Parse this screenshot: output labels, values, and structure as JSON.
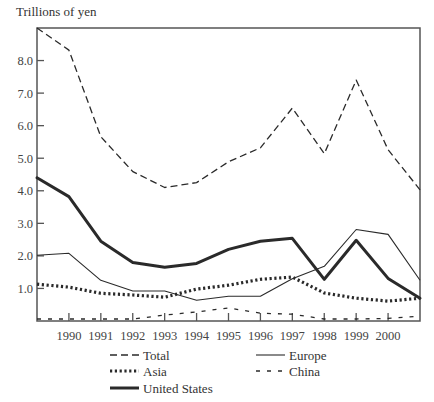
{
  "chart_data": {
    "type": "line",
    "title": "",
    "ylabel": "Trillions of yen",
    "xlabel": "",
    "x": [
      1989,
      1990,
      1991,
      1992,
      1993,
      1994,
      1995,
      1996,
      1997,
      1998,
      1999,
      2000,
      2001
    ],
    "x_tick_labels": [
      "1990",
      "1991",
      "1992",
      "1993",
      "1994",
      "1995",
      "1996",
      "1997",
      "1998",
      "1999",
      "2000"
    ],
    "y_tick_labels": [
      "1.0",
      "2.0",
      "3.0",
      "4.0",
      "5.0",
      "6.0",
      "7.0",
      "8.0"
    ],
    "y_ticks": [
      1,
      2,
      3,
      4,
      5,
      6,
      7,
      8
    ],
    "ylim": [
      0,
      9
    ],
    "xlim": [
      1989,
      2001
    ],
    "grid": false,
    "legend_position": "bottom",
    "series": [
      {
        "name": "Total",
        "style": "dashed",
        "values": [
          9.0,
          8.32,
          5.66,
          4.59,
          4.1,
          4.25,
          4.89,
          5.32,
          6.54,
          5.14,
          7.4,
          5.26,
          4.03
        ]
      },
      {
        "name": "Asia",
        "style": "dotted",
        "values": [
          1.13,
          1.04,
          0.85,
          0.8,
          0.73,
          0.98,
          1.1,
          1.28,
          1.35,
          0.86,
          0.7,
          0.61,
          0.7
        ]
      },
      {
        "name": "United States",
        "style": "thick",
        "values": [
          4.4,
          3.82,
          2.45,
          1.8,
          1.65,
          1.77,
          2.2,
          2.45,
          2.54,
          1.28,
          2.48,
          1.31,
          0.7
        ]
      },
      {
        "name": "Europe",
        "style": "thin",
        "values": [
          2.02,
          2.08,
          1.25,
          0.92,
          0.92,
          0.64,
          0.76,
          0.76,
          1.3,
          1.68,
          2.81,
          2.66,
          1.25
        ]
      },
      {
        "name": "China",
        "style": "sparse-dashed",
        "values": [
          0.06,
          0.06,
          0.06,
          0.06,
          0.18,
          0.28,
          0.4,
          0.24,
          0.21,
          0.06,
          0.06,
          0.08,
          0.15
        ]
      }
    ]
  },
  "legend": {
    "items": [
      {
        "label": "Total",
        "style": "dashed"
      },
      {
        "label": "Europe",
        "style": "thin"
      },
      {
        "label": "Asia",
        "style": "dotted"
      },
      {
        "label": "China",
        "style": "sparse-dashed"
      },
      {
        "label": "United States",
        "style": "thick"
      }
    ]
  },
  "colors": {
    "line": "#2a2a2a",
    "axis": "#555555",
    "text": "#333333"
  }
}
